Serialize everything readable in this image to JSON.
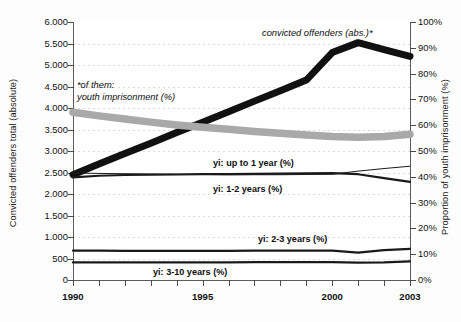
{
  "chart_data": {
    "type": "line",
    "title": "",
    "xlabel": "",
    "ylabel": "Convicted offenders total (absolute)",
    "y2label": "Proportion of youth imprisonment (%)",
    "x": [
      1990,
      1991,
      1992,
      1993,
      1994,
      1995,
      1996,
      1997,
      1998,
      1999,
      2000,
      2001,
      2002,
      2003
    ],
    "xticklabels": [
      "1990",
      "1995",
      "2000",
      "2003"
    ],
    "xlim": [
      1990,
      2003
    ],
    "ylim": [
      0,
      6000
    ],
    "yticklabels": [
      "6.000",
      "5.500",
      "5.000",
      "4.500",
      "4.000",
      "3.500",
      "3.000",
      "2.500",
      "2.000",
      "1.500",
      "1.000",
      "500",
      "0"
    ],
    "ytickvalues": [
      6000,
      5500,
      5000,
      4500,
      4000,
      3500,
      3000,
      2500,
      2000,
      1500,
      1000,
      500,
      0
    ],
    "y2lim": [
      0,
      100
    ],
    "y2ticklabels": [
      "100%",
      "90%",
      "80%",
      "70%",
      "60%",
      "50%",
      "40%",
      "30%",
      "20%",
      "10%",
      "0%"
    ],
    "y2tickvalues": [
      100,
      90,
      80,
      70,
      60,
      50,
      40,
      30,
      20,
      10,
      0
    ],
    "grid": true,
    "legend_position": "inline-annotations",
    "series": [
      {
        "name": "convicted offenders (abs.)*",
        "axis": "left",
        "style": "very-thick-black",
        "color": "#111111",
        "values": [
          2450,
          2700,
          2940,
          3180,
          3430,
          3670,
          3910,
          4160,
          4400,
          4650,
          5290,
          5520,
          5360,
          5200
        ]
      },
      {
        "name": "*of them: youth imprisonment (%)",
        "axis": "right",
        "style": "thick-gray-band",
        "color": "#a9a9a9",
        "values": [
          65.0,
          63.6,
          62.4,
          61.2,
          60.1,
          59.2,
          58.4,
          57.6,
          56.9,
          56.2,
          55.6,
          55.3,
          55.6,
          56.5
        ]
      },
      {
        "name": "yi: up to 1 year (%)",
        "axis": "right",
        "style": "thin-black",
        "color": "#1a1a1a",
        "values": [
          41.5,
          41.3,
          41.2,
          41.1,
          41.0,
          40.9,
          40.8,
          40.8,
          40.8,
          40.9,
          41.0,
          42.2,
          43.2,
          44.1
        ]
      },
      {
        "name": "yi: 1-2 years (%)",
        "axis": "right",
        "style": "medium-black",
        "color": "#1a1a1a",
        "values": [
          39.8,
          40.4,
          40.7,
          40.8,
          40.9,
          41.0,
          41.0,
          41.1,
          41.2,
          41.3,
          41.4,
          41.0,
          39.5,
          38.0
        ]
      },
      {
        "name": "yi: 2-3 years (%)",
        "axis": "right",
        "style": "medium-black",
        "color": "#1a1a1a",
        "values": [
          11.4,
          11.4,
          11.3,
          11.3,
          11.3,
          11.3,
          11.3,
          11.4,
          11.4,
          11.4,
          11.4,
          10.6,
          11.6,
          12.1
        ]
      },
      {
        "name": "yi: 3-10 years (%)",
        "axis": "right",
        "style": "medium-black",
        "color": "#1a1a1a",
        "values": [
          6.8,
          6.8,
          6.8,
          6.8,
          6.8,
          6.8,
          6.8,
          6.9,
          6.9,
          6.9,
          6.9,
          6.7,
          6.8,
          7.2
        ]
      }
    ],
    "annotations": [
      {
        "text": "convicted offenders (abs.)*",
        "style": "italic"
      },
      {
        "text": "*of them:",
        "style": "italic"
      },
      {
        "text": "youth imprisonment (%)",
        "style": "italic"
      },
      {
        "text": "yi: up to 1 year (%)",
        "style": "bold"
      },
      {
        "text": "yi: 1-2 years (%)",
        "style": "bold"
      },
      {
        "text": "yi: 2-3 years (%)",
        "style": "bold"
      },
      {
        "text": "yi: 3-10 years (%)",
        "style": "bold"
      }
    ]
  },
  "colors": {
    "series_black": "#111111",
    "series_gray": "#a9a9a9",
    "axis": "#5a5a5a",
    "grid": "#cfcfcf",
    "background": "#fdfdfd",
    "plot_background": "#ffffff"
  }
}
